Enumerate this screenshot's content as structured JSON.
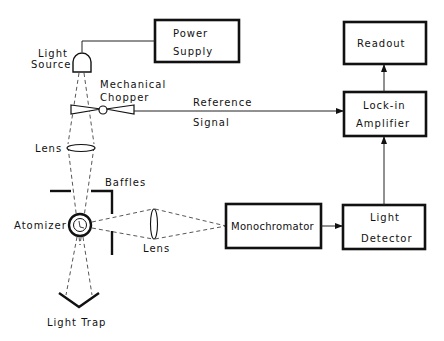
{
  "diagram": {
    "type": "block-diagram",
    "blocks": {
      "power_supply": {
        "line1": "Power",
        "line2": "Supply"
      },
      "readout": {
        "label": "Readout"
      },
      "lock_in": {
        "line1": "Lock-in",
        "line2": "Amplifier"
      },
      "monochromator": {
        "label": "Monochromator"
      },
      "light_detector": {
        "line1": "Light",
        "line2": "Detector"
      }
    },
    "components": {
      "light_source": {
        "line1": "Light",
        "line2": "Source"
      },
      "chopper": {
        "line1": "Mechanical",
        "line2": "Chopper"
      },
      "lens_top": {
        "label": "Lens"
      },
      "baffles": {
        "label": "Baffles"
      },
      "atomizer": {
        "label": "Atomizer"
      },
      "lens_side": {
        "label": "Lens"
      },
      "light_trap": {
        "label": "Light Trap"
      }
    },
    "signals": {
      "reference": {
        "line1": "Reference",
        "line2": "Signal"
      }
    },
    "connections": [
      {
        "from": "Power Supply",
        "to": "Light Source",
        "style": "solid"
      },
      {
        "from": "Light Source",
        "to": "Atomizer",
        "style": "dashed-beam",
        "via": [
          "Mechanical Chopper",
          "Lens"
        ]
      },
      {
        "from": "Mechanical Chopper",
        "to": "Lock-in Amplifier",
        "style": "arrow",
        "label": "Reference Signal"
      },
      {
        "from": "Atomizer",
        "to": "Monochromator",
        "style": "dashed-beam",
        "via": [
          "Lens"
        ]
      },
      {
        "from": "Atomizer",
        "to": "Light Trap",
        "style": "dashed-beam"
      },
      {
        "from": "Monochromator",
        "to": "Light Detector",
        "style": "arrow"
      },
      {
        "from": "Light Detector",
        "to": "Lock-in Amplifier",
        "style": "arrow"
      },
      {
        "from": "Lock-in Amplifier",
        "to": "Readout",
        "style": "arrow"
      }
    ]
  }
}
